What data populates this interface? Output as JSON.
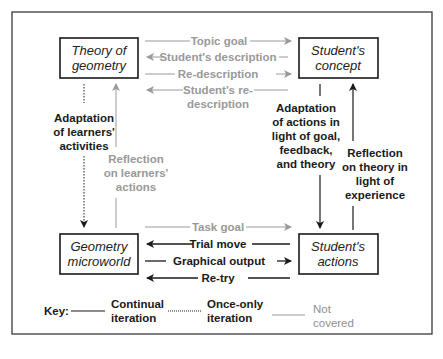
{
  "colors": {
    "black": "#1a1a1a",
    "grey": "#9a9a9a"
  },
  "boxes": {
    "theory": [
      "Theory of",
      "geometry"
    ],
    "concept": [
      "Student's",
      "concept"
    ],
    "microworld": [
      "Geometry",
      "microworld"
    ],
    "actions": [
      "Student's",
      "actions"
    ]
  },
  "top_arrows": {
    "topic_goal": "Topic goal",
    "students_description": "Student's description",
    "re_description": "Re-description",
    "students_re_description": [
      "Student's re-",
      "description"
    ]
  },
  "bottom_arrows": {
    "task_goal": "Task goal",
    "trial_move": "Trial move",
    "graphical_output": "Graphical output",
    "re_try": "Re-try"
  },
  "left_labels": {
    "adaptation_learners": [
      "Adaptation",
      "of learners'",
      "activities"
    ],
    "reflection_learners": [
      "Reflection",
      "on learners'",
      "actions"
    ]
  },
  "right_labels": {
    "adaptation_actions": [
      "Adaptation",
      "of actions in",
      "light of goal,",
      "feedback,",
      "and theory"
    ],
    "reflection_theory": [
      "Reflection",
      "on theory in",
      "light of",
      "experience"
    ]
  },
  "key": {
    "title": "Key:",
    "continual": [
      "Continual",
      "iteration"
    ],
    "once_only": [
      "Once-only",
      "iteration"
    ],
    "not_covered": [
      "Not",
      "covered"
    ]
  }
}
